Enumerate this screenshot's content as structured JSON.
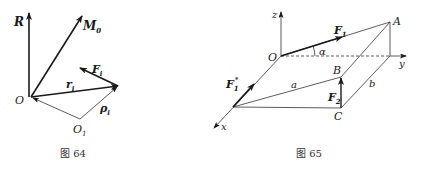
{
  "figure64": {
    "caption": "图 64",
    "labels": {
      "R": "R",
      "M0": "M",
      "M0_sub": "0",
      "O": "O",
      "O1": "O",
      "O1_sub": "1",
      "ri": "r",
      "ri_sub": "i",
      "Fi": "F",
      "Fi_sub": "i",
      "rhoi": "ρ",
      "rhoi_sub": "i"
    }
  },
  "figure65": {
    "caption": "图 65",
    "labels": {
      "z": "z",
      "y": "y",
      "x": "x",
      "O": "O",
      "A": "A",
      "B": "B",
      "C": "C",
      "a": "a",
      "b": "b",
      "alpha": "α",
      "F1": "F",
      "F1_sub": "1",
      "F1star": "F",
      "F1star_sub": "1",
      "F1star_sup": "*",
      "F2": "F",
      "F2_sub": "2"
    }
  },
  "colors": {
    "stroke": "#1a1a1a",
    "thin": "#333333"
  }
}
